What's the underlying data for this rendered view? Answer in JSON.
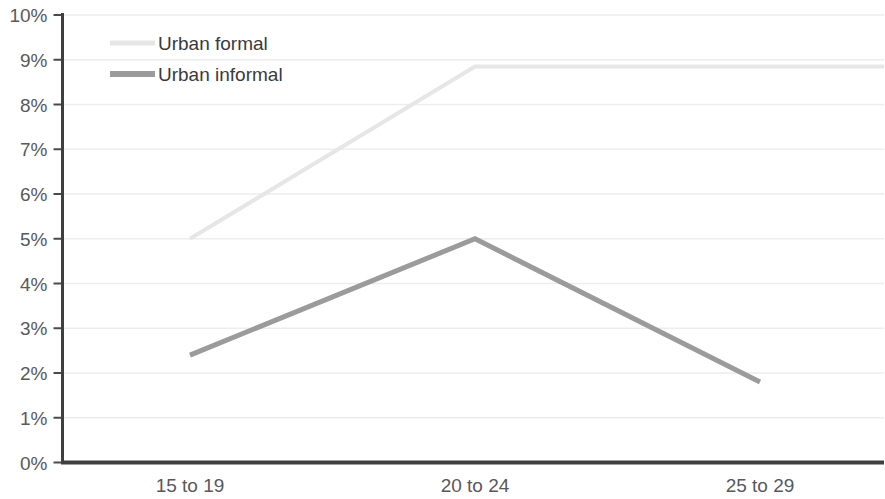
{
  "chart_data": {
    "type": "line",
    "title": "",
    "subtitle": "",
    "xlabel": "",
    "ylabel": "",
    "categories": [
      "15 to 19",
      "20 to 24",
      "25 to 29"
    ],
    "ylim": [
      0,
      10
    ],
    "ytick_labels": [
      "0%",
      "1%",
      "2%",
      "3%",
      "4%",
      "5%",
      "6%",
      "7%",
      "8%",
      "9%",
      "10%"
    ],
    "ytick_values": [
      0,
      1,
      2,
      3,
      4,
      5,
      6,
      7,
      8,
      9,
      10
    ],
    "grid": "horizontal",
    "legend_position": "top-left-inside",
    "series": [
      {
        "name": "Urban formal",
        "values": [
          5.0,
          8.85,
          8.85
        ],
        "color": "#e6e6e6",
        "line_width": 4
      },
      {
        "name": "Urban informal",
        "values": [
          2.4,
          5.0,
          1.8
        ],
        "color": "#9b9b9b",
        "line_width": 5
      }
    ],
    "colors": {
      "axis": "#3f3f3f",
      "grid": "#ededed",
      "tick_text": "#58595b",
      "legend_text": "#3a3a3c",
      "background": "#ffffff"
    }
  }
}
